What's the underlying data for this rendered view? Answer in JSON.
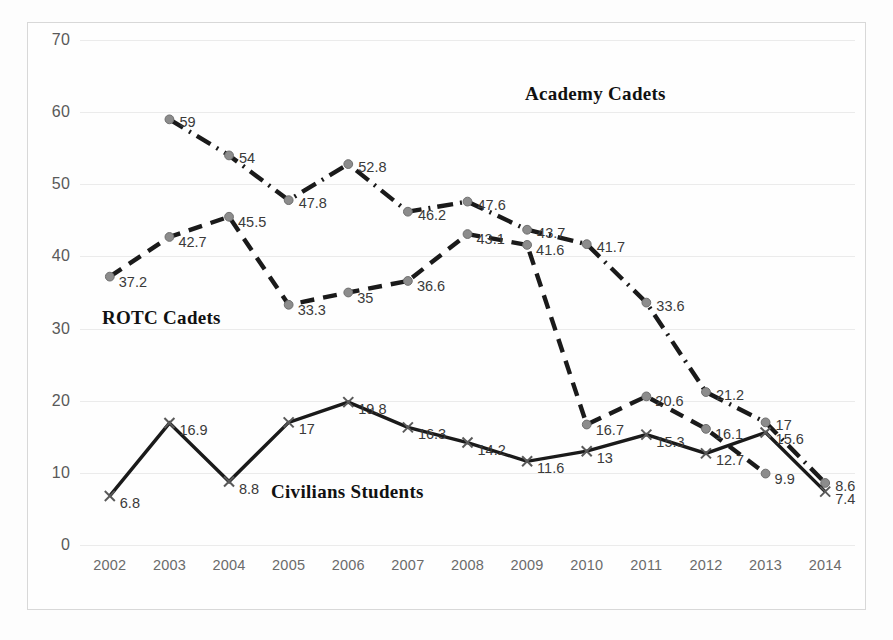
{
  "chart_data": {
    "type": "line",
    "title": "",
    "xlabel": "",
    "ylabel": "",
    "ylim": [
      0,
      70
    ],
    "ytick_step": 10,
    "grid": true,
    "legend_position": "inline-labels",
    "categories": [
      "2002",
      "2003",
      "2004",
      "2005",
      "2006",
      "2007",
      "2008",
      "2009",
      "2010",
      "2011",
      "2012",
      "2013",
      "2014"
    ],
    "yticks": [
      "0",
      "10",
      "20",
      "30",
      "40",
      "50",
      "60",
      "70"
    ],
    "series": [
      {
        "name": "ROTC Cadets",
        "style": "dashed",
        "marker": "circle",
        "color": "#1a1a1a",
        "marker_color": "#8c8c8c",
        "values": [
          37.2,
          42.7,
          45.5,
          33.3,
          35,
          36.6,
          43.1,
          41.6,
          16.7,
          20.6,
          16.1,
          9.9,
          null
        ],
        "labels": [
          "37.2",
          "42.7",
          "45.5",
          "33.3",
          "35",
          "36.6",
          "43.1",
          "41.6",
          "16.7",
          "20.6",
          "16.1",
          "9.9",
          ""
        ]
      },
      {
        "name": "Academy Cadets",
        "style": "dash-dot",
        "marker": "circle",
        "color": "#1a1a1a",
        "marker_color": "#8c8c8c",
        "values": [
          null,
          59,
          54,
          47.8,
          52.8,
          46.2,
          47.6,
          43.7,
          41.7,
          33.6,
          21.2,
          17,
          8.6
        ],
        "labels": [
          "",
          "59",
          "54",
          "47.8",
          "52.8",
          "46.2",
          "47.6",
          "43.7",
          "41.7",
          "33.6",
          "21.2",
          "17",
          "8.6"
        ]
      },
      {
        "name": "Civilians Students",
        "style": "solid",
        "marker": "x",
        "color": "#1a1a1a",
        "marker_color": "#595959",
        "values": [
          6.8,
          16.9,
          8.8,
          17,
          19.8,
          16.3,
          14.2,
          11.6,
          13,
          15.3,
          12.7,
          15.6,
          7.4
        ],
        "labels": [
          "6.8",
          "16.9",
          "8.8",
          "17",
          "19.8",
          "16.3",
          "14.2",
          "11.6",
          "13",
          "15.3",
          "12.7",
          "15.6",
          "7.4"
        ]
      }
    ],
    "inline_series_labels": [
      {
        "text": "Academy Cadets",
        "x_pct": 66.5,
        "y_value": 62.5
      },
      {
        "text": "ROTC Cadets",
        "x_pct": 10.5,
        "y_value": 31.5
      },
      {
        "text": "Civilians Students",
        "x_pct": 34.5,
        "y_value": 7.4
      }
    ]
  }
}
